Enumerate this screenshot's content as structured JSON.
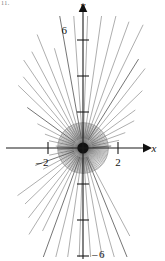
{
  "figure": {
    "title_fragment": "11.",
    "axes": {
      "x_label": "x",
      "y_label": "y",
      "x_tick_labels": [
        "2",
        "2"
      ],
      "x_tick_label_left": "2",
      "x_tick_label_left_sign": "–",
      "x_tick_label_right": "2",
      "y_tick_label_top": "6",
      "y_tick_label_bottom": "6",
      "y_tick_label_bottom_sign": "–"
    },
    "colors": {
      "axis": "#1a1a1a",
      "ray": "#6a6a6a",
      "ray_dark": "#3a3a3a",
      "circle": "#8a8a8a",
      "background": "#ffffff"
    }
  },
  "chart_data": {
    "type": "scatter",
    "title": "",
    "subtitle": "",
    "xlabel": "x",
    "ylabel": "y",
    "xlim": [
      -4.7,
      4.7
    ],
    "ylim": [
      -6.9,
      7.0
    ],
    "grid": false,
    "legend": null,
    "x_ticks": [
      -2,
      2
    ],
    "y_ticks": [
      -6,
      -4,
      -2,
      2,
      4,
      6
    ],
    "x_tick_labels": [
      "2",
      "2"
    ],
    "y_tick_labels": [
      "6",
      "",
      "",
      "",
      "",
      "6"
    ],
    "labeled_y_ticks": [
      6,
      -6
    ],
    "origin_px": [
      83,
      148
    ],
    "px_per_unit_x": 17.5,
    "px_per_unit_y": 18.0,
    "rays": {
      "count": 44,
      "angles_deg": [
        4,
        12,
        20,
        28,
        36,
        44,
        52,
        58,
        64,
        70,
        76,
        82,
        88,
        94,
        100,
        106,
        112,
        118,
        124,
        130,
        136,
        144,
        152,
        160,
        168,
        176,
        184,
        192,
        200,
        208,
        216,
        224,
        232,
        238,
        244,
        250,
        256,
        262,
        268,
        274,
        280,
        286,
        292,
        298
      ],
      "inner_radius_units": 0.55,
      "outer_radius_units_range": [
        1.4,
        7.2
      ]
    },
    "core": {
      "dot_radius_units": 0.32,
      "halo_radius_units": 1.45,
      "halo_spokes": 120
    }
  }
}
